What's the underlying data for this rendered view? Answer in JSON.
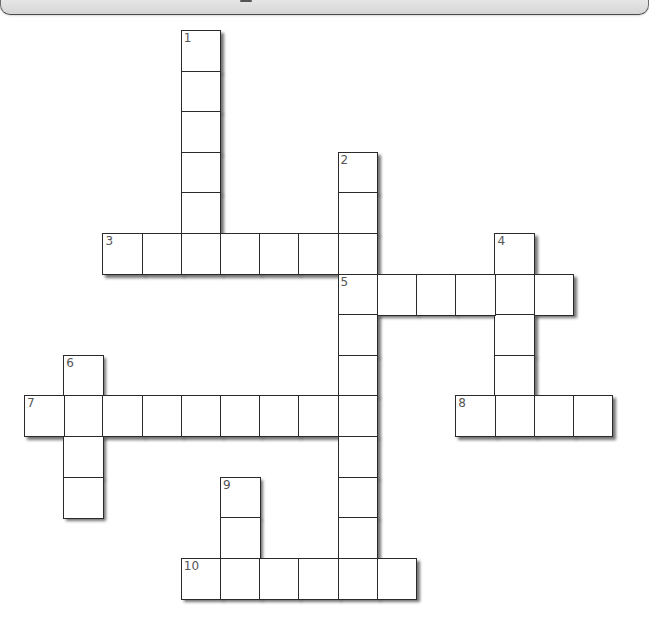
{
  "puzzle": {
    "type": "crossword",
    "grid_origin": {
      "x": 24,
      "y": 30
    },
    "cell_width": 39.2,
    "cell_height": 40.6,
    "colors": {
      "cell_fill": "#ffffff",
      "cell_border": "#2a2a2a",
      "number_text": "#555555",
      "top_bar": "#dcdcdc"
    },
    "words": [
      {
        "number": "1",
        "direction": "down",
        "row": 0,
        "col": 4,
        "length": 6
      },
      {
        "number": "2",
        "direction": "down",
        "row": 3,
        "col": 8,
        "length": 11
      },
      {
        "number": "3",
        "direction": "across",
        "row": 5,
        "col": 2,
        "length": 7
      },
      {
        "number": "4",
        "direction": "down",
        "row": 5,
        "col": 12,
        "length": 5
      },
      {
        "number": "5",
        "direction": "across",
        "row": 6,
        "col": 8,
        "length": 6
      },
      {
        "number": "6",
        "direction": "down",
        "row": 8,
        "col": 1,
        "length": 4
      },
      {
        "number": "7",
        "direction": "across",
        "row": 9,
        "col": 0,
        "length": 9
      },
      {
        "number": "8",
        "direction": "across",
        "row": 9,
        "col": 11,
        "length": 4
      },
      {
        "number": "9",
        "direction": "down",
        "row": 11,
        "col": 5,
        "length": 3
      },
      {
        "number": "10",
        "direction": "across",
        "row": 13,
        "col": 4,
        "length": 6
      }
    ]
  }
}
